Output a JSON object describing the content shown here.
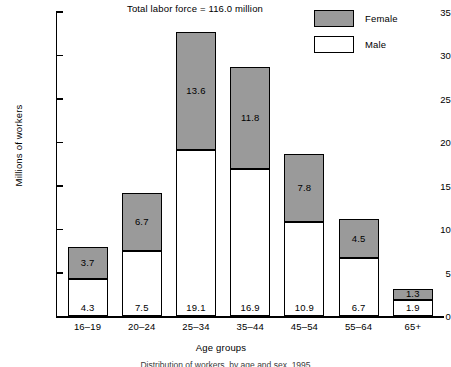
{
  "chart_data": {
    "type": "bar",
    "subtype": "stacked-bar",
    "title": "Total labor force = 116.0 million",
    "xlabel": "Age groups",
    "ylabel": "Millions of workers",
    "categories": [
      "16–19",
      "20–24",
      "25–34",
      "35–44",
      "45–54",
      "55–64",
      "65+"
    ],
    "series": [
      {
        "name": "Male",
        "color": "#ffffff",
        "values": [
          4.3,
          7.5,
          19.1,
          16.9,
          10.9,
          6.7,
          1.9
        ]
      },
      {
        "name": "Female",
        "color": "#9a9a9a",
        "values": [
          3.7,
          6.7,
          13.6,
          11.8,
          7.8,
          4.5,
          1.3
        ]
      }
    ],
    "totals": [
      8.0,
      14.2,
      32.7,
      28.7,
      18.7,
      11.2,
      3.2
    ],
    "ylim": [
      0,
      35
    ],
    "yticks": [
      0,
      5,
      10,
      15,
      20,
      25,
      30,
      35
    ],
    "ytick_labels": [
      "0",
      "5",
      "10",
      "15",
      "20",
      "25",
      "30",
      "35"
    ],
    "grid": false,
    "legend_position": "top-right",
    "stack_order": [
      "Male",
      "Female"
    ]
  },
  "legend": {
    "items": [
      {
        "label": "Female",
        "swatch": "female"
      },
      {
        "label": "Male",
        "swatch": "male"
      }
    ]
  },
  "caption": {
    "text": "Distribution of workers, by age and sex, 1995"
  }
}
